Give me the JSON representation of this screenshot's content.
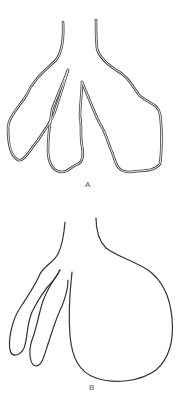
{
  "figures": [
    {
      "id": "A",
      "label": "A",
      "description": "Branching structure with three lobes, drawn with double-line outline"
    },
    {
      "id": "B",
      "label": "B",
      "description": "Branching structure with two narrow lobes on left and one large rounded lobe on right"
    }
  ],
  "colors": {
    "stroke": "#333333",
    "background": "#ffffff",
    "label": "#555555"
  }
}
